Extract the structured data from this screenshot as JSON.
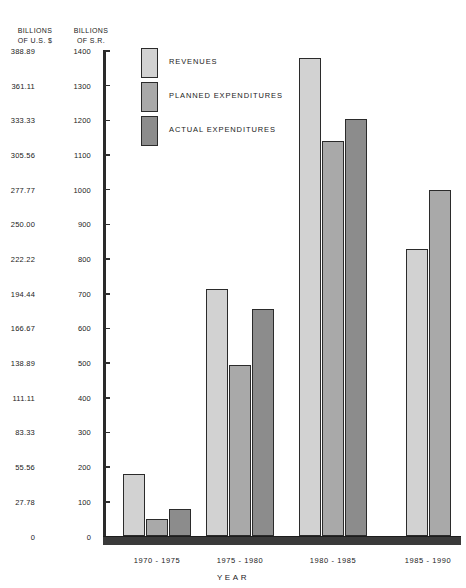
{
  "axes": {
    "left_caption": "BILLIONS\nOF U.S. $",
    "right_caption": "BILLIONS\nOF S.R.",
    "xlabel": "YEAR",
    "usd_ticks": [
      "388.89",
      "361.11",
      "333.33",
      "305.56",
      "277.77",
      "250.00",
      "222.22",
      "194.44",
      "166.67",
      "138.89",
      "111.11",
      "83.33",
      "55.56",
      "27.78",
      "0"
    ],
    "sr_ticks": [
      "1400",
      "1300",
      "1200",
      "1100",
      "1000",
      "900",
      "800",
      "700",
      "600",
      "500",
      "400",
      "300",
      "200",
      "100",
      "0"
    ]
  },
  "legend": {
    "items": [
      {
        "label": "REVENUES",
        "color": "#d2d2d2"
      },
      {
        "label": "PLANNED EXPENDITURES",
        "color": "#a9a9a9"
      },
      {
        "label": "ACTUAL EXPENDITURES",
        "color": "#8c8c8c"
      }
    ]
  },
  "chart_data": {
    "type": "bar",
    "title": "",
    "xlabel": "YEAR",
    "ylabel": "BILLIONS OF S.R.",
    "ylabel_secondary": "BILLIONS OF U.S. $",
    "ylim": [
      0,
      1400
    ],
    "ytick_step": 100,
    "grid": false,
    "legend_position": "top-left",
    "categories": [
      "1970 - 1975",
      "1975 - 1980",
      "1980 - 1985",
      "1985 - 1990"
    ],
    "series": [
      {
        "name": "REVENUES",
        "color": "#d2d2d2",
        "values": [
          180,
          715,
          1380,
          830
        ]
      },
      {
        "name": "PLANNED EXPENDITURES",
        "color": "#a9a9a9",
        "values": [
          50,
          495,
          1140,
          1000
        ]
      },
      {
        "name": "ACTUAL EXPENDITURES",
        "color": "#8c8c8c",
        "values": [
          80,
          655,
          1205,
          null
        ]
      }
    ]
  }
}
